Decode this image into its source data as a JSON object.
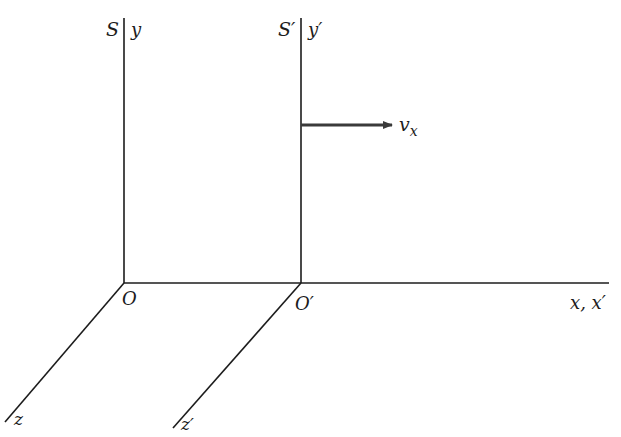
{
  "diagram": {
    "type": "reference-frames",
    "frames": [
      {
        "name": "S",
        "frame_label": "S",
        "origin_label": "O",
        "axis_labels": {
          "y": "y",
          "z": "z"
        }
      },
      {
        "name": "S'",
        "frame_label": "S′",
        "origin_label": "O′",
        "axis_labels": {
          "y": "y′",
          "z": "z′"
        }
      }
    ],
    "shared_x_axis_label": "x, x′",
    "velocity": {
      "label_main": "v",
      "label_sub": "x",
      "direction": "+x"
    },
    "colors": {
      "line": "#1c1c1c",
      "arrow": "#3a3a3a",
      "background": "#ffffff"
    }
  }
}
